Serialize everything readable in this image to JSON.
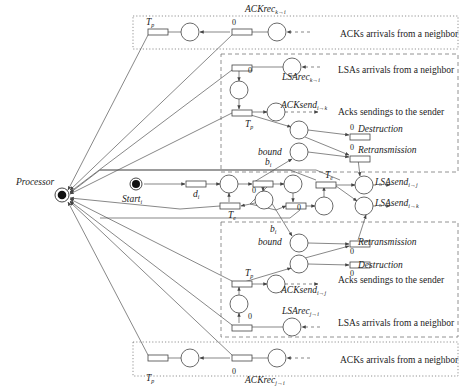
{
  "processor": {
    "label": "Processor",
    "x": 62,
    "y": 195
  },
  "start": {
    "label": "Start",
    "sub": "i",
    "x": 136,
    "y": 184
  },
  "regions": [
    {
      "id": "ack-top",
      "style": "dotted",
      "x": 133,
      "y": 16,
      "w": 325,
      "h": 33,
      "caption": "ACKs arrivals from a neighbor",
      "cx": 340,
      "cy": 37
    },
    {
      "id": "lsa-upper",
      "style": "dashed",
      "x": 221,
      "y": 54,
      "w": 237,
      "h": 118
    },
    {
      "id": "lsa-lower",
      "style": "dashed",
      "x": 221,
      "y": 222,
      "w": 237,
      "h": 115
    },
    {
      "id": "ack-bottom",
      "style": "dotted",
      "x": 133,
      "y": 342,
      "w": 325,
      "h": 34,
      "caption": "ACKs arrivals from a neighbor",
      "cx": 340,
      "cy": 363
    }
  ],
  "captions": [
    {
      "text": "LSAs arrivals from a neighbor",
      "x": 338,
      "y": 73
    },
    {
      "text": "Acks sendings to the sender",
      "x": 338,
      "y": 115
    },
    {
      "text": "Acks sendings to the sender",
      "x": 338,
      "y": 283
    },
    {
      "text": "LSAs arrivals from a neighbor",
      "x": 338,
      "y": 326
    }
  ],
  "labels": [
    {
      "text": "ACKrec",
      "sub": "k→i",
      "x": 245,
      "y": 12,
      "italic": true
    },
    {
      "text": "T",
      "sub": "p",
      "x": 146,
      "y": 25,
      "italic": true
    },
    {
      "text": "0",
      "x": 232,
      "y": 25,
      "zero": true
    },
    {
      "text": "LSArec",
      "sub": "k→i",
      "x": 282,
      "y": 80,
      "italic": true
    },
    {
      "text": "0",
      "x": 248,
      "y": 73,
      "zero": true
    },
    {
      "text": "ACKsend",
      "sub": "i→k",
      "x": 281,
      "y": 108,
      "italic": true
    },
    {
      "text": "T",
      "sub": "p",
      "x": 245,
      "y": 127,
      "italic": true
    },
    {
      "text": "0",
      "x": 350,
      "y": 130,
      "zero": true
    },
    {
      "text": "Destruction",
      "x": 358,
      "y": 132,
      "italic": true
    },
    {
      "text": "bound",
      "x": 258,
      "y": 155,
      "italic": true
    },
    {
      "text": "0",
      "x": 350,
      "y": 150,
      "zero": true
    },
    {
      "text": "Retransmission",
      "x": 358,
      "y": 153,
      "italic": true
    },
    {
      "text": "b",
      "sub": "i",
      "x": 265,
      "y": 165,
      "italic": true
    },
    {
      "text": "d",
      "sub": "i",
      "x": 193,
      "y": 197,
      "italic": true
    },
    {
      "text": "0",
      "x": 252,
      "y": 193,
      "zero": true
    },
    {
      "text": "T",
      "sub": "e",
      "x": 228,
      "y": 218,
      "italic": true
    },
    {
      "text": "T",
      "sub": "e",
      "x": 325,
      "y": 178,
      "italic": true
    },
    {
      "text": "0",
      "x": 297,
      "y": 210,
      "zero": true
    },
    {
      "text": "LSAsend",
      "sub": "i→j",
      "x": 375,
      "y": 185,
      "italic": true
    },
    {
      "text": "LSAsend",
      "sub": "i→k",
      "x": 375,
      "y": 206,
      "italic": true
    },
    {
      "text": "b",
      "sub": "i",
      "x": 270,
      "y": 232,
      "italic": true
    },
    {
      "text": "bound",
      "x": 258,
      "y": 245,
      "italic": true
    },
    {
      "text": "Retransmission",
      "x": 358,
      "y": 245,
      "italic": true
    },
    {
      "text": "0",
      "x": 350,
      "y": 254,
      "zero": true
    },
    {
      "text": "Destruction",
      "x": 358,
      "y": 268,
      "italic": true
    },
    {
      "text": "0",
      "x": 350,
      "y": 276,
      "zero": true
    },
    {
      "text": "T",
      "sub": "p",
      "x": 245,
      "y": 276,
      "italic": true
    },
    {
      "text": "ACKsend",
      "sub": "i→j",
      "x": 281,
      "y": 293,
      "italic": true
    },
    {
      "text": "LSArec",
      "sub": "j→i",
      "x": 282,
      "y": 314,
      "italic": true
    },
    {
      "text": "0",
      "x": 248,
      "y": 319,
      "zero": true
    },
    {
      "text": "T",
      "sub": "p",
      "x": 146,
      "y": 381,
      "italic": true
    },
    {
      "text": "0",
      "x": 232,
      "y": 374,
      "zero": true
    },
    {
      "text": "ACKrec",
      "sub": "j→i",
      "x": 245,
      "y": 383,
      "italic": true
    }
  ],
  "places": [
    {
      "x": 190,
      "y": 32
    },
    {
      "x": 277,
      "y": 32
    },
    {
      "x": 292,
      "y": 67
    },
    {
      "x": 239,
      "y": 90
    },
    {
      "x": 276,
      "y": 112
    },
    {
      "x": 299,
      "y": 130
    },
    {
      "x": 299,
      "y": 152
    },
    {
      "x": 229,
      "y": 184
    },
    {
      "x": 293,
      "y": 184
    },
    {
      "x": 264,
      "y": 200
    },
    {
      "x": 324,
      "y": 206
    },
    {
      "x": 364,
      "y": 185
    },
    {
      "x": 364,
      "y": 206
    },
    {
      "x": 299,
      "y": 243
    },
    {
      "x": 299,
      "y": 264
    },
    {
      "x": 276,
      "y": 284
    },
    {
      "x": 239,
      "y": 304
    },
    {
      "x": 292,
      "y": 327
    },
    {
      "x": 190,
      "y": 358
    },
    {
      "x": 277,
      "y": 358
    }
  ],
  "transitions": [
    {
      "x": 148,
      "y": 29
    },
    {
      "x": 232,
      "y": 29
    },
    {
      "x": 232,
      "y": 65
    },
    {
      "x": 232,
      "y": 110
    },
    {
      "x": 350,
      "y": 134
    },
    {
      "x": 350,
      "y": 156
    },
    {
      "x": 186,
      "y": 181
    },
    {
      "x": 253,
      "y": 181
    },
    {
      "x": 220,
      "y": 203
    },
    {
      "x": 316,
      "y": 182
    },
    {
      "x": 286,
      "y": 203
    },
    {
      "x": 350,
      "y": 241
    },
    {
      "x": 350,
      "y": 262
    },
    {
      "x": 232,
      "y": 281
    },
    {
      "x": 232,
      "y": 325
    },
    {
      "x": 148,
      "y": 355
    },
    {
      "x": 232,
      "y": 355
    }
  ],
  "legend": {
    "dotted": "ACK arrival region",
    "dashed": "LSA processing region"
  }
}
